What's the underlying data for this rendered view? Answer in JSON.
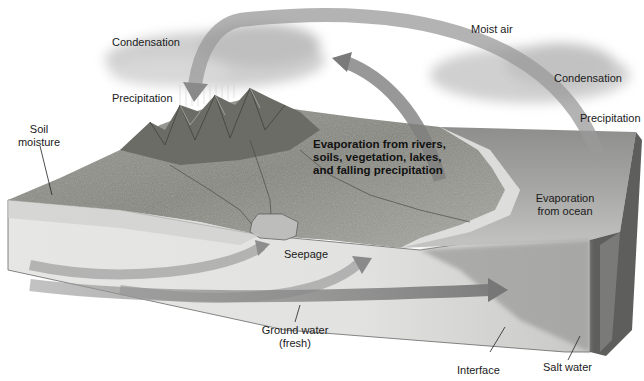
{
  "diagram": {
    "type": "hydrologic-cycle-block-diagram",
    "colors": {
      "background": "#ffffff",
      "land": "#8c8c86",
      "land_dark": "#5d5d58",
      "mountain": "#707068",
      "groundwater_face": "#e4e4e2",
      "ocean_top": "#9a9a98",
      "ocean_side": "#6e6e6c",
      "arrow": "#8a8a8a",
      "arrow_dark": "#666666",
      "cloud": "#d4d4d4",
      "text": "#1a1a1a",
      "leader_line": "#222222"
    },
    "labels": {
      "condensation_left": "Condensation",
      "precipitation_left": "Precipitation",
      "soil_moisture_1": "Soil",
      "soil_moisture_2": "moisture",
      "moist_air": "Moist air",
      "condensation_right": "Condensation",
      "precipitation_right": "Precipitation",
      "evap_land_1": "Evaporation from rivers,",
      "evap_land_2": "soils, vegetation, lakes,",
      "evap_land_3": "and falling precipitation",
      "evap_ocean_1": "Evaporation",
      "evap_ocean_2": "from ocean",
      "seepage": "Seepage",
      "groundwater_1": "Ground water",
      "groundwater_2": "(fresh)",
      "interface": "Interface",
      "salt_water": "Salt water"
    }
  }
}
